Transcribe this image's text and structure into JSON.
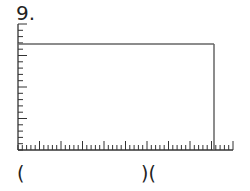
{
  "problem": {
    "number_label": "9.",
    "answer_left": "(",
    "answer_right": ")(",
    "colors": {
      "axis": "#333333",
      "rectangle": "#666666"
    }
  },
  "grid": {
    "origin": {
      "x": 18,
      "y": 150
    },
    "y_axis_top": 24,
    "x_axis_right": 233,
    "y_tick_spacing": 6.3,
    "x_tick_spacing": 4.3,
    "major_every": 5,
    "rectangle": {
      "top_y": 44,
      "right_x": 214
    }
  }
}
